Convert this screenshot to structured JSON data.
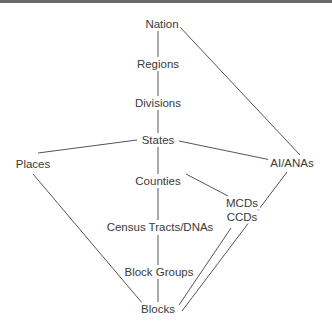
{
  "diagram": {
    "nodes": [
      {
        "id": "nation",
        "label": "Nation",
        "x": 162,
        "y": 24
      },
      {
        "id": "regions",
        "label": "Regions",
        "x": 158,
        "y": 64
      },
      {
        "id": "divisions",
        "label": "Divisions",
        "x": 158,
        "y": 103
      },
      {
        "id": "states",
        "label": "States",
        "x": 158,
        "y": 140
      },
      {
        "id": "places",
        "label": "Places",
        "x": 33,
        "y": 164
      },
      {
        "id": "aiana",
        "label": "AI/ANAs",
        "x": 292,
        "y": 163
      },
      {
        "id": "counties",
        "label": "Counties",
        "x": 158,
        "y": 181
      },
      {
        "id": "mcds",
        "label": "MCDs",
        "x": 242,
        "y": 203
      },
      {
        "id": "ccds",
        "label": "CCDs",
        "x": 242,
        "y": 217
      },
      {
        "id": "tracts",
        "label": "Census Tracts/DNAs",
        "x": 160,
        "y": 227
      },
      {
        "id": "blockgroups",
        "label": "Block Groups",
        "x": 159,
        "y": 272
      },
      {
        "id": "blocks",
        "label": "Blocks",
        "x": 158,
        "y": 309
      }
    ],
    "edges": [
      {
        "from": "nation",
        "to": "regions",
        "x1": 158,
        "y1": 31,
        "x2": 158,
        "y2": 57
      },
      {
        "from": "regions",
        "to": "divisions",
        "x1": 158,
        "y1": 71,
        "x2": 158,
        "y2": 96
      },
      {
        "from": "divisions",
        "to": "states",
        "x1": 158,
        "y1": 110,
        "x2": 158,
        "y2": 133
      },
      {
        "from": "states",
        "to": "counties",
        "x1": 158,
        "y1": 147,
        "x2": 158,
        "y2": 174
      },
      {
        "from": "counties",
        "to": "tracts",
        "x1": 158,
        "y1": 188,
        "x2": 158,
        "y2": 220
      },
      {
        "from": "tracts",
        "to": "blockgroups",
        "x1": 158,
        "y1": 235,
        "x2": 158,
        "y2": 265
      },
      {
        "from": "blockgroups",
        "to": "blocks",
        "x1": 158,
        "y1": 279,
        "x2": 158,
        "y2": 302
      },
      {
        "from": "nation",
        "to": "aiana",
        "x1": 179,
        "y1": 26,
        "x2": 300,
        "y2": 155
      },
      {
        "from": "states",
        "to": "places",
        "x1": 137,
        "y1": 140,
        "x2": 38,
        "y2": 153
      },
      {
        "from": "states",
        "to": "aiana",
        "x1": 179,
        "y1": 141,
        "x2": 271,
        "y2": 160
      },
      {
        "from": "counties",
        "to": "mcds",
        "x1": 186,
        "y1": 174,
        "x2": 228,
        "y2": 196
      },
      {
        "from": "places",
        "to": "blocks",
        "x1": 33,
        "y1": 174,
        "x2": 143,
        "y2": 304
      },
      {
        "from": "ccds",
        "to": "blocks",
        "x1": 231,
        "y1": 228,
        "x2": 179,
        "y2": 305
      },
      {
        "from": "aiana",
        "to": "blocks",
        "x1": 287,
        "y1": 172,
        "x2": 182,
        "y2": 311
      }
    ]
  }
}
